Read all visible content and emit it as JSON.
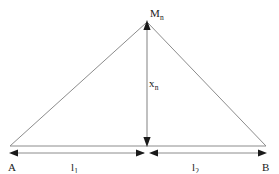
{
  "figure": {
    "type": "geometry-diagram",
    "background_color": "#ffffff",
    "line_color": "#8c8c8c",
    "arrow_color": "#1a1a1a",
    "text_color": "#1a1a1a",
    "labels": {
      "apex": {
        "base": "M",
        "sub": "n"
      },
      "height": {
        "base": "x",
        "sub": "n"
      },
      "left_vertex": {
        "base": "A",
        "sub": ""
      },
      "right_vertex": {
        "base": "B",
        "sub": ""
      },
      "segment_left": {
        "base": "l",
        "sub": "1"
      },
      "segment_right": {
        "base": "l",
        "sub": "2"
      }
    },
    "geometry": {
      "apex_x": 147,
      "apex_y": 22,
      "base_y": 146,
      "left_x": 10,
      "right_x": 266,
      "dimension_line_y": 153,
      "midpoint_x": 147
    }
  }
}
